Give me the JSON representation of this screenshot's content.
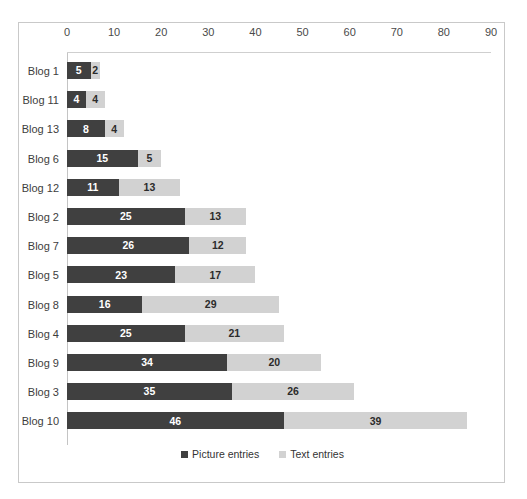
{
  "chart_data": {
    "type": "bar",
    "subtype": "horizontal-stacked-bar",
    "title": "",
    "xlabel": "",
    "ylabel": "",
    "xlim": [
      0,
      90
    ],
    "xticks": [
      0,
      10,
      20,
      30,
      40,
      50,
      60,
      70,
      80,
      90
    ],
    "tick_step": 10,
    "grid": false,
    "axis_position": "top",
    "legend_position": "bottom-center",
    "categories": [
      "Blog 1",
      "Blog 11",
      "Blog 13",
      "Blog 6",
      "Blog 12",
      "Blog 2",
      "Blog 7",
      "Blog 5",
      "Blog 8",
      "Blog 4",
      "Blog 9",
      "Blog 3",
      "Blog 10"
    ],
    "series": [
      {
        "name": "Picture entries",
        "color": "#404040",
        "values": [
          5,
          4,
          8,
          15,
          11,
          25,
          26,
          23,
          16,
          25,
          34,
          35,
          46
        ]
      },
      {
        "name": "Text entries",
        "color": "#d2d2d2",
        "values": [
          2,
          4,
          4,
          5,
          13,
          13,
          12,
          17,
          29,
          21,
          20,
          26,
          39
        ]
      }
    ],
    "totals": [
      7,
      8,
      12,
      20,
      24,
      38,
      38,
      40,
      45,
      46,
      54,
      61,
      85
    ]
  },
  "legend": {
    "items": [
      {
        "label": "Picture entries",
        "swatch": "picture"
      },
      {
        "label": "Text entries",
        "swatch": "text"
      }
    ]
  },
  "top_remnant": ""
}
